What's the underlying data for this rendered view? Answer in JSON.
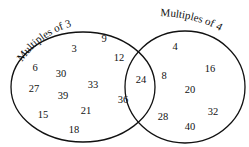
{
  "diagram": {
    "type": "venn",
    "sets": [
      {
        "label": "Multiples of 3",
        "only": [
          3,
          6,
          9,
          15,
          18,
          21,
          27,
          30,
          33,
          39
        ]
      },
      {
        "label": "Multiples of 4",
        "only": [
          4,
          8,
          16,
          20,
          28,
          32,
          40
        ]
      }
    ],
    "intersection": [
      12,
      24,
      36
    ],
    "items": [
      {
        "v": "9",
        "x": 104,
        "y": 38
      },
      {
        "v": "3",
        "x": 74,
        "y": 48
      },
      {
        "v": "6",
        "x": 35,
        "y": 67
      },
      {
        "v": "30",
        "x": 61,
        "y": 73
      },
      {
        "v": "27",
        "x": 34,
        "y": 88
      },
      {
        "v": "39",
        "x": 63,
        "y": 95
      },
      {
        "v": "33",
        "x": 93,
        "y": 84
      },
      {
        "v": "21",
        "x": 86,
        "y": 110
      },
      {
        "v": "15",
        "x": 43,
        "y": 114
      },
      {
        "v": "18",
        "x": 74,
        "y": 129
      },
      {
        "v": "12",
        "x": 119,
        "y": 57
      },
      {
        "v": "24",
        "x": 141,
        "y": 79
      },
      {
        "v": "36",
        "x": 123,
        "y": 99
      },
      {
        "v": "4",
        "x": 175,
        "y": 46
      },
      {
        "v": "16",
        "x": 210,
        "y": 68
      },
      {
        "v": "8",
        "x": 164,
        "y": 75
      },
      {
        "v": "20",
        "x": 190,
        "y": 89
      },
      {
        "v": "28",
        "x": 163,
        "y": 116
      },
      {
        "v": "32",
        "x": 213,
        "y": 111
      },
      {
        "v": "40",
        "x": 190,
        "y": 126
      }
    ]
  }
}
